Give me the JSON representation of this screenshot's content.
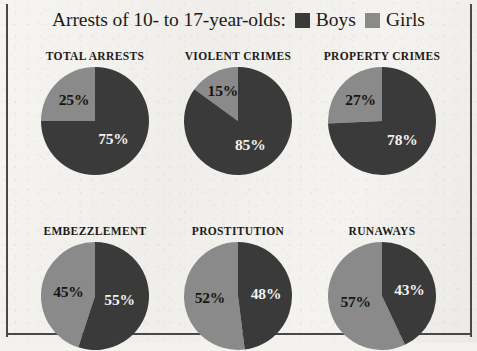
{
  "header": {
    "title": "Arrests of 10- to 17-year-olds:",
    "legend": [
      {
        "label": "Boys",
        "color": "#3a3a3a"
      },
      {
        "label": "Girls",
        "color": "#8a8a8a"
      }
    ]
  },
  "chart_data": {
    "type": "pie",
    "title": "Arrests of 10- to 17-year-olds:",
    "legend_position": "top-right",
    "series_names": [
      "Boys",
      "Girls"
    ],
    "colors": {
      "Boys": "#3a3a3a",
      "Girls": "#8a8a8a"
    },
    "units": "percent",
    "charts": [
      {
        "title": "TOTAL ARRESTS",
        "values": {
          "Boys": 75,
          "Girls": 25
        },
        "boys_label": "75%",
        "girls_label": "25%"
      },
      {
        "title": "VIOLENT CRIMES",
        "values": {
          "Boys": 85,
          "Girls": 15
        },
        "boys_label": "85%",
        "girls_label": "15%"
      },
      {
        "title": "PROPERTY CRIMES",
        "values": {
          "Boys": 78,
          "Girls": 27
        },
        "boys_label": "78%",
        "girls_label": "27%"
      },
      {
        "title": "EMBEZZLEMENT",
        "values": {
          "Boys": 55,
          "Girls": 45
        },
        "boys_label": "55%",
        "girls_label": "45%"
      },
      {
        "title": "PROSTITUTION",
        "values": {
          "Boys": 48,
          "Girls": 52
        },
        "boys_label": "48%",
        "girls_label": "52%"
      },
      {
        "title": "RUNAWAYS",
        "values": {
          "Boys": 43,
          "Girls": 57
        },
        "boys_label": "43%",
        "girls_label": "57%"
      }
    ]
  }
}
